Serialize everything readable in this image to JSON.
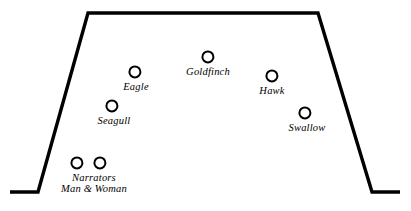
{
  "diagram": {
    "type": "stage-blocking-chart",
    "stage_shape": "trapezoid",
    "stroke_color": "#000000",
    "marker_color": "#000000",
    "background_color": "#ffffff",
    "stage_outline": {
      "points": "10,192 38,192 88,13 318,13 372,192 400,192",
      "stroke_width": 3.4
    },
    "marker_radius": 6.6,
    "marker_stroke_width": 2.6,
    "positions": [
      {
        "id": "goldfinch",
        "label_lines": [
          "Goldfinch"
        ],
        "cx": 208,
        "cy": 57,
        "label_x": 208,
        "label_y": 66,
        "font_size": 10.5
      },
      {
        "id": "eagle",
        "label_lines": [
          "Eagle"
        ],
        "cx": 135,
        "cy": 72,
        "label_x": 136,
        "label_y": 81,
        "font_size": 10.5
      },
      {
        "id": "hawk",
        "label_lines": [
          "Hawk"
        ],
        "cx": 272,
        "cy": 76,
        "label_x": 272,
        "label_y": 85,
        "font_size": 10.5
      },
      {
        "id": "seagull",
        "label_lines": [
          "Seagull"
        ],
        "cx": 112,
        "cy": 106,
        "label_x": 114,
        "label_y": 115,
        "font_size": 10.5
      },
      {
        "id": "swallow",
        "label_lines": [
          "Swallow"
        ],
        "cx": 305,
        "cy": 113,
        "label_x": 307,
        "label_y": 122,
        "font_size": 10.5
      },
      {
        "id": "narrator-man",
        "label_lines": [],
        "cx": 77,
        "cy": 163,
        "label_x": 0,
        "label_y": 0,
        "font_size": 10.5
      },
      {
        "id": "narrator-woman",
        "label_lines": [],
        "cx": 100,
        "cy": 163,
        "label_x": 0,
        "label_y": 0,
        "font_size": 10.5
      },
      {
        "id": "narrators",
        "label_lines": [
          "Narrators",
          "Man & Woman"
        ],
        "cx": null,
        "cy": null,
        "label_x": 94,
        "label_y": 172,
        "font_size": 10.5
      }
    ]
  }
}
